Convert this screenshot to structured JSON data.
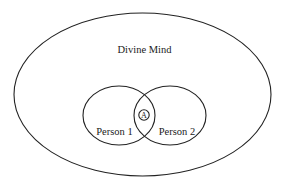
{
  "diagram": {
    "type": "nested-venn",
    "outer": {
      "label": "Divine Mind"
    },
    "sets": [
      {
        "label": "Person 1"
      },
      {
        "label": "Person 2"
      }
    ],
    "intersection": {
      "label": "A"
    },
    "colors": {
      "stroke": "#222222",
      "text": "#1a1a1a",
      "background": "#ffffff"
    }
  }
}
